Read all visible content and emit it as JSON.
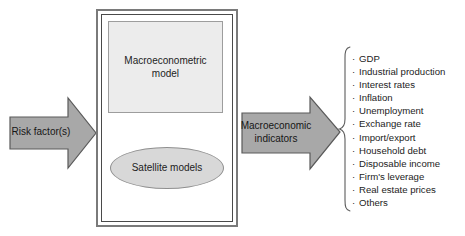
{
  "figure": {
    "type": "flow-diagram",
    "background_color": "#ffffff"
  },
  "input_arrow": {
    "label": "Risk factor(s)",
    "direction": "right",
    "fill_color": "#a8a8a8",
    "stroke_color": "#5a5a5a"
  },
  "model_container": {
    "macroeconometric_model": {
      "label": "Macroeconometric\nmodel",
      "fill_color": "#ececec",
      "stroke_color": "#9d9d9d"
    },
    "satellite_models": {
      "label": "Satellite models",
      "fill_color": "#d8d8d8",
      "stroke_color": "#8f8f8f"
    },
    "border_color": "#7a7a7a"
  },
  "output_arrow": {
    "label": "Macroeconomic\nindicators",
    "direction": "right",
    "fill_color": "#a8a8a8",
    "stroke_color": "#5a5a5a"
  },
  "indicators": {
    "bullet": "·",
    "items": [
      "GDP",
      "Industrial production",
      "Interest rates",
      "Inflation",
      "Unemployment",
      "Exchange rate",
      "Import/export",
      "Household debt",
      "Disposable income",
      "Firm's leverage",
      "Real estate prices",
      "Others"
    ]
  }
}
